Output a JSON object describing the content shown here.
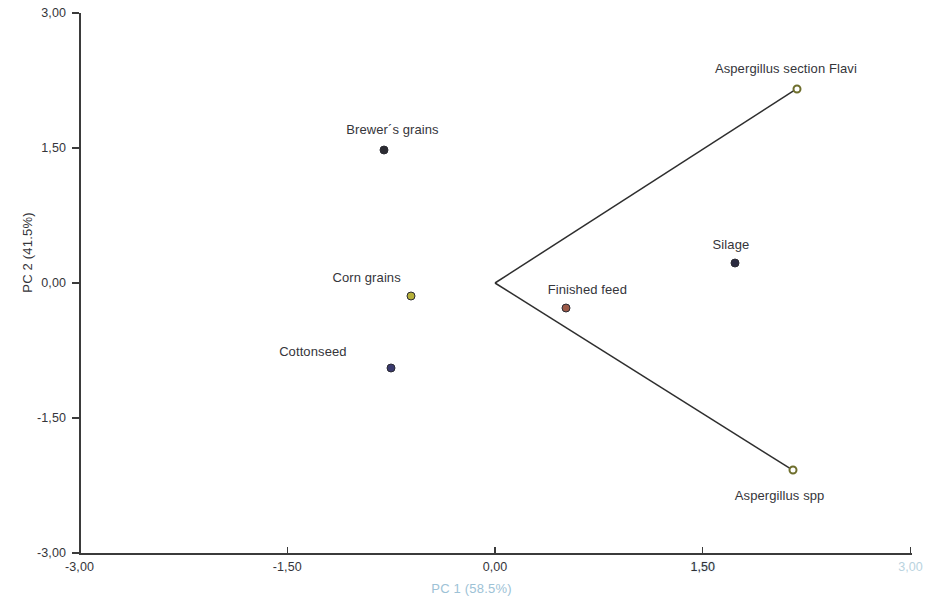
{
  "chart_data": {
    "type": "scatter",
    "title": "",
    "subtitle": "",
    "xlabel": "PC 1 (58.5%)",
    "ylabel": "PC 2 (41.5%)",
    "xlim": [
      -3.0,
      3.0
    ],
    "ylim": [
      -3.0,
      3.0
    ],
    "grid": false,
    "legend": false,
    "legend_position": "none",
    "x_tick_labels": [
      "-3,00",
      "-1,50",
      "0,00",
      "1,50",
      "3,00"
    ],
    "x_tick_values": [
      -3.0,
      -1.5,
      0.0,
      1.5,
      3.0
    ],
    "y_tick_labels": [
      "-3,00",
      "-1,50",
      "0,00",
      "1,50",
      "3,00"
    ],
    "y_tick_values": [
      -3.0,
      -1.5,
      0.0,
      1.5,
      3.0
    ],
    "decimal_separator": ",",
    "points": [
      {
        "label": "Brewer´s grains",
        "x": -0.8,
        "y": 1.48,
        "marker": "filled",
        "color": "#2b2b33",
        "label_dx": -38,
        "label_dy": -28
      },
      {
        "label": "Corn grains",
        "x": -0.61,
        "y": -0.14,
        "marker": "filled",
        "color": "#b6b03a",
        "label_dx": -78,
        "label_dy": -26
      },
      {
        "label": "Cottonseed",
        "x": -0.75,
        "y": -0.94,
        "marker": "filled",
        "color": "#3a3a6e",
        "label_dx": -112,
        "label_dy": -24
      },
      {
        "label": "Finished feed",
        "x": 0.51,
        "y": -0.28,
        "marker": "filled",
        "color": "#9c5a48",
        "label_dx": -18,
        "label_dy": -26
      },
      {
        "label": "Silage",
        "x": 1.73,
        "y": 0.22,
        "marker": "filled",
        "color": "#2b2b40",
        "label_dx": -22,
        "label_dy": -26
      },
      {
        "label": "Aspergillus section Flavi",
        "x": 2.18,
        "y": 2.16,
        "marker": "open",
        "color": "#6e6e2c",
        "label_dx": -82,
        "label_dy": -28
      },
      {
        "label": "Aspergillus spp",
        "x": 2.15,
        "y": -2.08,
        "marker": "open",
        "color": "#6e6e2c",
        "label_dx": -58,
        "label_dy": 18
      }
    ],
    "vectors": [
      {
        "name": "vector-to-aspergillus-section-flavi",
        "x0": 0.0,
        "y0": 0.0,
        "x1": 2.18,
        "y1": 2.16
      },
      {
        "name": "vector-to-aspergillus-spp",
        "x0": 0.0,
        "y0": 0.0,
        "x1": 2.15,
        "y1": -2.08
      }
    ],
    "vector_color": "#2e2e2e",
    "annotations": []
  }
}
